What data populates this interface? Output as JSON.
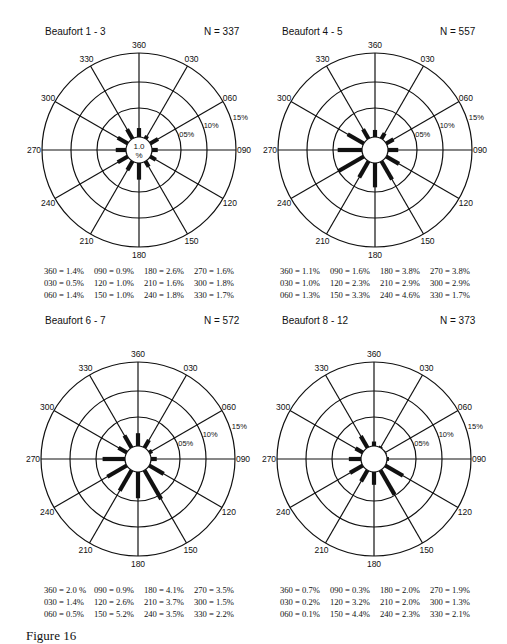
{
  "caption": "Figure 16",
  "scale": {
    "rings": [
      "05%",
      "10%",
      "15%"
    ],
    "center_label_top": "1.0",
    "center_label_bottom": "%"
  },
  "directions": [
    "360",
    "030",
    "060",
    "090",
    "120",
    "150",
    "180",
    "210",
    "240",
    "270",
    "300",
    "330"
  ],
  "panels": [
    {
      "title": "Beaufort  1 - 3",
      "n": "N = 337",
      "values": {
        "360": 1.4,
        "030": 0.5,
        "060": 1.4,
        "090": 0.9,
        "120": 1.0,
        "150": 1.0,
        "180": 2.6,
        "210": 1.6,
        "240": 1.8,
        "270": 1.6,
        "300": 1.8,
        "330": 1.7
      },
      "stats": [
        "360 = 1.4%",
        "030 = 0.5%",
        "060 = 1.4%",
        "090 = 0.9%",
        "120 = 1.0%",
        "150 = 1.0%",
        "180 = 2.6%",
        "210 = 1.6%",
        "240 = 1.8%",
        "270 = 1.6%",
        "300 = 1.8%",
        "330 = 1.7%"
      ],
      "show_center_label": true
    },
    {
      "title": "Beaufort  4 - 5",
      "n": "N = 557",
      "values": {
        "360": 1.1,
        "030": 1.0,
        "060": 1.3,
        "090": 1.6,
        "120": 2.3,
        "150": 3.3,
        "180": 3.8,
        "210": 2.9,
        "240": 4.6,
        "270": 3.8,
        "300": 2.9,
        "330": 1.7
      },
      "stats": [
        "360 = 1.1%",
        "030 = 1.0%",
        "060 = 1.3%",
        "090 = 1.6%",
        "120 = 2.3%",
        "150 = 3.3%",
        "180 = 3.8%",
        "210 = 2.9%",
        "240 = 4.6%",
        "270 = 3.8%",
        "300 = 2.9%",
        "330 = 1.7%"
      ],
      "show_center_label": false
    },
    {
      "title": "Beaufort  6 - 7",
      "n": "N = 572",
      "values": {
        "360": 2.0,
        "030": 1.4,
        "060": 0.5,
        "090": 0.9,
        "120": 2.6,
        "150": 5.2,
        "180": 4.1,
        "210": 3.7,
        "240": 3.5,
        "270": 3.5,
        "300": 1.5,
        "330": 2.2
      },
      "stats": [
        "360 = 2.0 %",
        "030 = 1.4%",
        "060 = 0.5%",
        "090 = 0.9%",
        "120 = 2.6%",
        "150 = 5.2%",
        "180 = 4.1%",
        "210 = 3.7%",
        "240 = 3.5%",
        "270 = 3.5%",
        "300 = 1.5%",
        "330 = 2.2%"
      ],
      "show_center_label": false
    },
    {
      "title": "Beaufort  8 - 12",
      "n": "N = 373",
      "values": {
        "360": 0.7,
        "030": 0.2,
        "060": 0.1,
        "090": 0.3,
        "120": 3.2,
        "150": 4.4,
        "180": 2.0,
        "210": 2.0,
        "240": 2.3,
        "270": 1.9,
        "300": 1.3,
        "330": 2.1
      },
      "stats": [
        "360 = 0.7%",
        "030 = 0.2%",
        "060 = 0.1%",
        "090 = 0.3%",
        "120 = 3.2%",
        "150 = 4.4%",
        "180 = 2.0%",
        "210 = 2.0%",
        "240 = 2.3%",
        "270 = 1.9%",
        "300 = 1.3%",
        "330 = 2.1%"
      ],
      "show_center_label": false
    }
  ],
  "chart_data": [
    {
      "type": "rose",
      "title": "Beaufort 1 - 3",
      "subtitle": "N = 337",
      "categories": [
        "360",
        "030",
        "060",
        "090",
        "120",
        "150",
        "180",
        "210",
        "240",
        "270",
        "300",
        "330"
      ],
      "values": [
        1.4,
        0.5,
        1.4,
        0.9,
        1.0,
        1.0,
        2.6,
        1.6,
        1.8,
        1.6,
        1.8,
        1.7
      ],
      "rings": [
        "05%",
        "10%",
        "15%"
      ],
      "center": "1.0 %"
    },
    {
      "type": "rose",
      "title": "Beaufort 4 - 5",
      "subtitle": "N = 557",
      "categories": [
        "360",
        "030",
        "060",
        "090",
        "120",
        "150",
        "180",
        "210",
        "240",
        "270",
        "300",
        "330"
      ],
      "values": [
        1.1,
        1.0,
        1.3,
        1.6,
        2.3,
        3.3,
        3.8,
        2.9,
        4.6,
        3.8,
        2.9,
        1.7
      ],
      "rings": [
        "05%",
        "10%",
        "15%"
      ]
    },
    {
      "type": "rose",
      "title": "Beaufort 6 - 7",
      "subtitle": "N = 572",
      "categories": [
        "360",
        "030",
        "060",
        "090",
        "120",
        "150",
        "180",
        "210",
        "240",
        "270",
        "300",
        "330"
      ],
      "values": [
        2.0,
        1.4,
        0.5,
        0.9,
        2.6,
        5.2,
        4.1,
        3.7,
        3.5,
        3.5,
        1.5,
        2.2
      ],
      "rings": [
        "05%",
        "10%",
        "15%"
      ]
    },
    {
      "type": "rose",
      "title": "Beaufort 8 - 12",
      "subtitle": "N = 373",
      "categories": [
        "360",
        "030",
        "060",
        "090",
        "120",
        "150",
        "180",
        "210",
        "240",
        "270",
        "300",
        "330"
      ],
      "values": [
        0.7,
        0.2,
        0.1,
        0.3,
        3.2,
        4.4,
        2.0,
        2.0,
        2.3,
        1.9,
        1.3,
        2.1
      ],
      "rings": [
        "05%",
        "10%",
        "15%"
      ]
    }
  ]
}
